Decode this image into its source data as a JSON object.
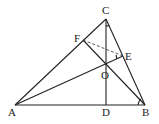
{
  "diagram": {
    "type": "geometry-triangle",
    "points": {
      "A": {
        "label": "A",
        "x": 15,
        "y": 105
      },
      "B": {
        "label": "B",
        "x": 145,
        "y": 105
      },
      "C": {
        "label": "C",
        "x": 106,
        "y": 19
      },
      "D": {
        "label": "D",
        "x": 106,
        "y": 105
      },
      "E": {
        "label": "E",
        "x": 123,
        "y": 56
      },
      "F": {
        "label": "F",
        "x": 83,
        "y": 40
      },
      "O": {
        "label": "O",
        "x": 106,
        "y": 63
      }
    },
    "segments": [
      [
        "A",
        "B"
      ],
      [
        "B",
        "C"
      ],
      [
        "C",
        "A"
      ],
      [
        "C",
        "D"
      ],
      [
        "A",
        "E"
      ],
      [
        "B",
        "F"
      ]
    ],
    "dashed_segments": [
      [
        "F",
        "E"
      ]
    ],
    "angle_marks": [
      "C",
      "E",
      "B"
    ]
  }
}
